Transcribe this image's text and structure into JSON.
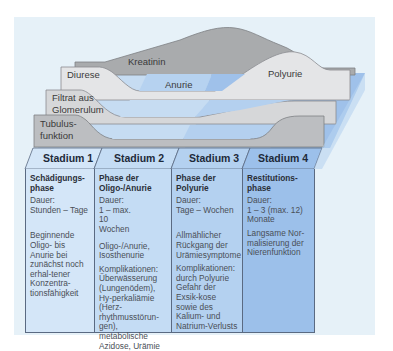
{
  "layers": [
    {
      "label": "Kreatinin",
      "color": "#a9abad"
    },
    {
      "label": "Diurese",
      "color": "#e4e5e7",
      "inner_label": "Anurie",
      "end_label": "Polyurie"
    },
    {
      "label_line1": "Filtrat aus",
      "label_line2": "Glomerulum",
      "color": "#d6d7d9"
    },
    {
      "label_line1": "Tubulus-",
      "label_line2": "funktion",
      "color": "#bcbec1"
    }
  ],
  "stages": [
    {
      "header": "Stadium 1",
      "title_line1": "Schädigungs-",
      "title_line2": "phase",
      "duration_label": "Dauer:",
      "duration": "Stunden – Tage",
      "description": "Beginnende Oligo- bis Anurie bei zunächst noch erhal-tener Konzentra-tionsfähigkeit",
      "complications": ""
    },
    {
      "header": "Stadium 2",
      "title_line1": "Phase der",
      "title_line2": "Oligo-/Anurie",
      "duration_label": "Dauer:",
      "duration": "1 – max. 10 Wochen",
      "description": "Oligo-/Anurie, Isosthenurie",
      "complications": "Komplikationen: Überwässerung (Lungenödem), Hy-perkaliämie (Herz-rhythmusstörun-gen), metabolische Azidose, Urämie"
    },
    {
      "header": "Stadium 3",
      "title_line1": "Phase der",
      "title_line2": "Polyurie",
      "duration_label": "Dauer:",
      "duration": "Tage – Wochen",
      "description": "Allmählicher Rückgang der Urämiesymptome",
      "complications": "Komplikationen: durch Polyurie Gefahr der Exsik-kose sowie des Kalium- und Natrium-Verlusts"
    },
    {
      "header": "Stadium 4",
      "title_line1": "Restitutions-",
      "title_line2": "phase",
      "duration_label": "Dauer:",
      "duration": "1 – 3 (max. 12) Monate",
      "description": "Langsame Nor-malisierung der Nierenfunktion",
      "complications": ""
    }
  ],
  "colors": {
    "panel_bg": "#e6f1f8",
    "stage1": "#d4e6f8",
    "stage2": "#c4dcf4",
    "stage3": "#b4d1f0",
    "stage4": "#9cc0ea",
    "border": "#5a6a82"
  }
}
